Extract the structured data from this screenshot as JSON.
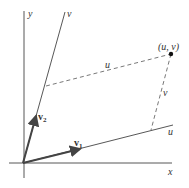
{
  "diagram": {
    "axes": {
      "x_label": "x",
      "y_label": "y",
      "u_label": "u",
      "v_label": "v"
    },
    "vectors": [
      {
        "name": "v1",
        "label_main": "v",
        "label_sub": "1"
      },
      {
        "name": "v2",
        "label_main": "v",
        "label_sub": "2"
      }
    ],
    "point": {
      "label": "(u, v)"
    },
    "dashed_labels": {
      "parallel_to_u": "u",
      "parallel_to_v": "v"
    },
    "colors": {
      "line": "#444444",
      "text": "#333333",
      "background": "#ffffff"
    }
  }
}
